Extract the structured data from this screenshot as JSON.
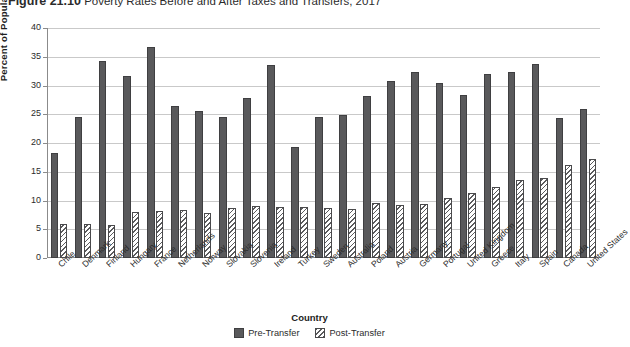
{
  "figure": {
    "number": "Figure 21.10",
    "caption": "Poverty Rates Before and After Taxes and Transfers, 2017"
  },
  "chart_data": {
    "type": "bar",
    "title": "Poverty Rates Before and After Taxes and Transfers, 2017",
    "xlabel": "Country",
    "ylabel": "Percent of Population",
    "ylim": [
      0,
      40
    ],
    "yticks": [
      0,
      5,
      10,
      15,
      20,
      25,
      30,
      35,
      40
    ],
    "grid": true,
    "legend_position": "bottom",
    "categories": [
      "Chile",
      "Denmark",
      "Finland",
      "Hungary",
      "France",
      "Netherlands",
      "Norway",
      "Slovakia",
      "Slovenia",
      "Ireland",
      "Turkey",
      "Sweden",
      "Australia",
      "Poland",
      "Austria",
      "Germany",
      "Portugal",
      "United Kingdom",
      "Greece",
      "Italy",
      "Spain",
      "Canada",
      "United States"
    ],
    "series": [
      {
        "name": "Pre-Transfer",
        "color": "#59595b",
        "pattern": "solid",
        "values": [
          18.3,
          24.6,
          34.2,
          31.6,
          36.7,
          26.5,
          25.5,
          24.5,
          27.8,
          33.6,
          19.3,
          24.6,
          24.9,
          28.1,
          30.7,
          32.3,
          30.5,
          28.4,
          32.0,
          32.4,
          33.8,
          24.4,
          26.0
        ]
      },
      {
        "name": "Post-Transfer",
        "color": "#5b5b5d",
        "pattern": "diagonal-hatch",
        "values": [
          5.9,
          5.9,
          5.8,
          8.0,
          8.1,
          8.3,
          7.9,
          8.7,
          9.0,
          8.9,
          8.8,
          8.7,
          8.6,
          9.6,
          9.3,
          9.4,
          10.4,
          11.3,
          12.3,
          13.5,
          13.9,
          16.1,
          17.3
        ]
      }
    ]
  }
}
